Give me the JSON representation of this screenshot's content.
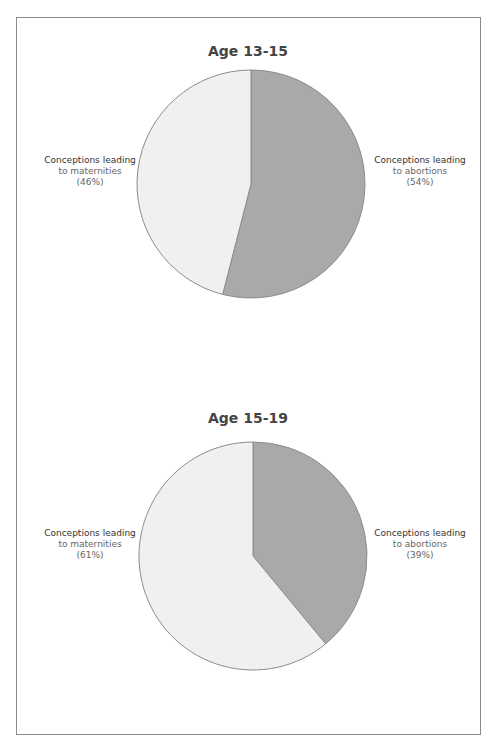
{
  "chart_data": [
    {
      "type": "pie",
      "title": "Age 13-15",
      "slices": [
        {
          "label": "Conceptions leading to abortions",
          "value": 54,
          "color": "#a9a9a9"
        },
        {
          "label": "Conceptions leading to maternities",
          "value": 46,
          "color": "#f0f0f0"
        }
      ]
    },
    {
      "type": "pie",
      "title": "Age 15-19",
      "slices": [
        {
          "label": "Conceptions leading to abortions",
          "value": 39,
          "color": "#a9a9a9"
        },
        {
          "label": "Conceptions leading to maternities",
          "value": 61,
          "color": "#f0f0f0"
        }
      ]
    }
  ],
  "charts": [
    {
      "title": "Age 13-15",
      "left_label": {
        "line1": "Conceptions leading",
        "line2": "to maternities",
        "line3": "(46%)"
      },
      "right_label": {
        "line1": "Conceptions leading",
        "line2": "to abortions",
        "line3": "(54%)"
      }
    },
    {
      "title": "Age 15-19",
      "left_label": {
        "line1": "Conceptions leading",
        "line2": "to maternities",
        "line3": "(61%)"
      },
      "right_label": {
        "line1": "Conceptions leading",
        "line2": "to abortions",
        "line3": "(39%)"
      }
    }
  ],
  "colors": {
    "abortions": "#a9a9a9",
    "maternities": "#f0f0f0",
    "stroke": "#8c8c8c"
  }
}
